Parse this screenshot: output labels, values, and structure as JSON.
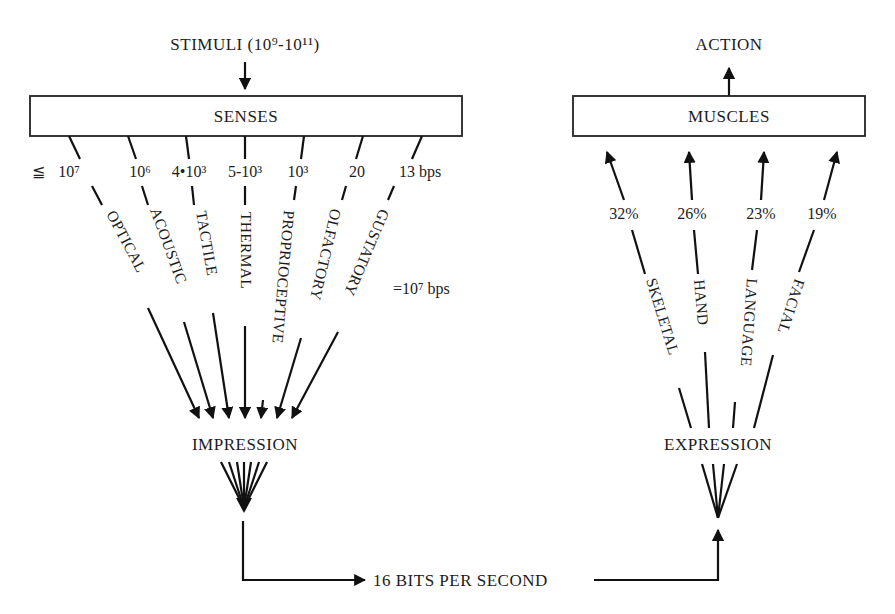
{
  "input": {
    "stimuli_label": "STIMULI (10⁹-10¹¹)",
    "senses_box": "SENSES",
    "rate_prefix": "≦",
    "senses": [
      {
        "name": "OPTICAL",
        "rate": "10⁷"
      },
      {
        "name": "ACOUSTIC",
        "rate": "10⁶"
      },
      {
        "name": "TACTILE",
        "rate": "4•10³"
      },
      {
        "name": "THERMAL",
        "rate": "5-10³"
      },
      {
        "name": "PROPRIOCEPTIVE",
        "rate": "10³"
      },
      {
        "name": "OLFACTORY",
        "rate": "20"
      },
      {
        "name": "GUSTATORY",
        "rate": "13 bps"
      }
    ],
    "total_label": "=10⁷ bps",
    "impression_label": "IMPRESSION"
  },
  "channel": {
    "label": "16 BITS PER SECOND"
  },
  "output": {
    "action_label": "ACTION",
    "muscles_box": "MUSCLES",
    "channels": [
      {
        "name": "SKELETAL",
        "share": "32%"
      },
      {
        "name": "HAND",
        "share": "26%"
      },
      {
        "name": "LANGUAGE",
        "share": "23%"
      },
      {
        "name": "FACIAL",
        "share": "19%"
      }
    ],
    "expression_label": "EXPRESSION"
  }
}
